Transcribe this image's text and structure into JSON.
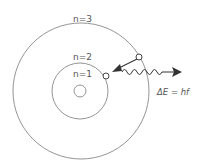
{
  "diagram": {
    "orbits": [
      {
        "label": "n=1"
      },
      {
        "label": "n=2"
      },
      {
        "label": "n=3"
      }
    ],
    "equation": "ΔE = hf",
    "colors": {
      "stroke": "#777777",
      "arrow": "#333333",
      "text": "#555555"
    }
  }
}
